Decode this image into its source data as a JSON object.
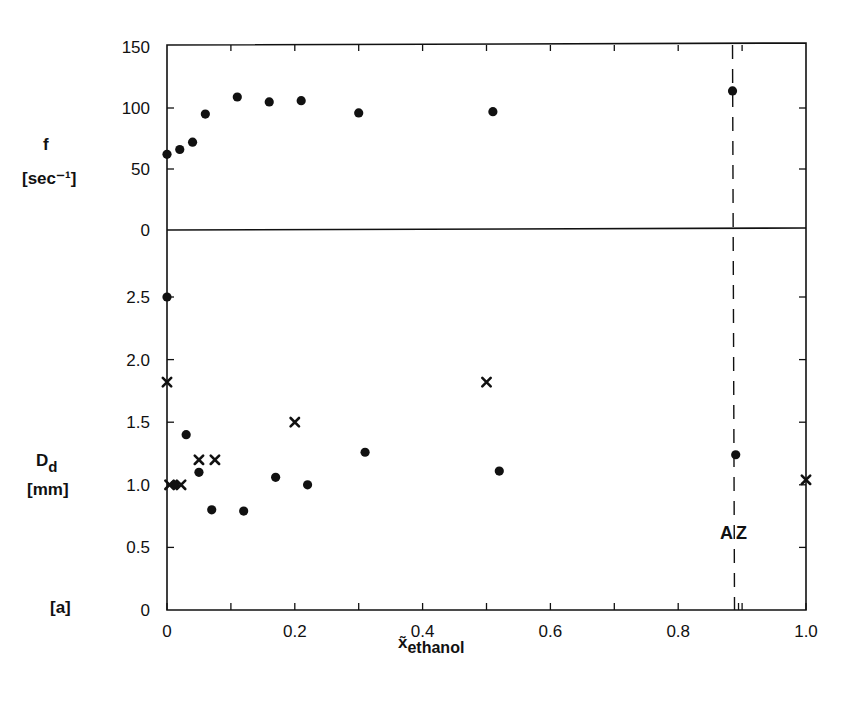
{
  "chart_data": {
    "type": "scatter",
    "panel_label": "[a]",
    "xlabel": "x̃",
    "xlabel_sub": "ethanol",
    "xlim": [
      0,
      1.0
    ],
    "x_ticks": [
      "0",
      "0.2",
      "0.4",
      "0.6",
      "0.8",
      "1.0"
    ],
    "annotation": "AZ",
    "azeotrope_x": 0.885,
    "panels": [
      {
        "name": "frequency",
        "ylabel": "f",
        "yunit": "[sec⁻¹]",
        "ylim": [
          0,
          150
        ],
        "y_ticks": [
          "150",
          "100",
          "50",
          "0"
        ],
        "series": [
          {
            "name": "f (circles)",
            "marker": "circle",
            "x": [
              0.0,
              0.02,
              0.04,
              0.06,
              0.11,
              0.16,
              0.21,
              0.3,
              0.51,
              0.885
            ],
            "y": [
              62,
              66,
              72,
              95,
              109,
              105,
              106,
              96,
              97,
              114
            ]
          }
        ]
      },
      {
        "name": "droplet-diameter",
        "ylabel": "D",
        "ylabel_sub": "d",
        "yunit": "[mm]",
        "ylim": [
          0,
          2.5
        ],
        "y_ticks": [
          "2.5",
          "2.0",
          "1.5",
          "1.0",
          "0.5",
          "0"
        ],
        "series": [
          {
            "name": "D_d (circles)",
            "marker": "circle",
            "x": [
              0.0,
              0.012,
              0.03,
              0.05,
              0.07,
              0.12,
              0.17,
              0.22,
              0.31,
              0.52,
              0.89
            ],
            "y": [
              2.5,
              1.0,
              1.4,
              1.1,
              0.8,
              0.79,
              1.06,
              1.0,
              1.26,
              1.11,
              1.24
            ]
          },
          {
            "name": "D_d (crosses)",
            "marker": "x",
            "x": [
              0.0,
              0.004,
              0.022,
              0.05,
              0.075,
              0.2,
              0.5,
              1.0
            ],
            "y": [
              1.82,
              1.0,
              1.0,
              1.2,
              1.2,
              1.5,
              1.82,
              1.04
            ]
          }
        ]
      }
    ]
  }
}
